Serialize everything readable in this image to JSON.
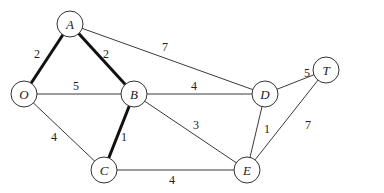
{
  "diagram": {
    "type": "weighted-undirected-graph",
    "nodes": [
      {
        "id": "A",
        "label": "A",
        "x": 70,
        "y": 24
      },
      {
        "id": "O",
        "label": "O",
        "x": 24,
        "y": 94
      },
      {
        "id": "B",
        "label": "B",
        "x": 134,
        "y": 94
      },
      {
        "id": "D",
        "label": "D",
        "x": 265,
        "y": 94
      },
      {
        "id": "T",
        "label": "T",
        "x": 326,
        "y": 70
      },
      {
        "id": "C",
        "label": "C",
        "x": 104,
        "y": 170
      },
      {
        "id": "E",
        "label": "E",
        "x": 247,
        "y": 170
      }
    ],
    "edges": [
      {
        "from": "O",
        "to": "A",
        "weight": "2",
        "highlighted": true,
        "lx": 37,
        "ly": 54
      },
      {
        "from": "A",
        "to": "B",
        "weight": "2",
        "highlighted": true,
        "lx": 106,
        "ly": 54
      },
      {
        "from": "A",
        "to": "D",
        "weight": "7",
        "highlighted": false,
        "lx": 165,
        "ly": 47
      },
      {
        "from": "O",
        "to": "B",
        "weight": "5",
        "highlighted": false,
        "lx": 76,
        "ly": 86
      },
      {
        "from": "B",
        "to": "D",
        "weight": "4",
        "highlighted": false,
        "lx": 194,
        "ly": 86
      },
      {
        "from": "D",
        "to": "T",
        "weight": "5",
        "highlighted": false,
        "lx": 307,
        "ly": 73
      },
      {
        "from": "O",
        "to": "C",
        "weight": "4",
        "highlighted": false,
        "lx": 54,
        "ly": 137
      },
      {
        "from": "B",
        "to": "C",
        "weight": "1",
        "highlighted": true,
        "lx": 124,
        "ly": 137
      },
      {
        "from": "B",
        "to": "E",
        "weight": "3",
        "highlighted": false,
        "lx": 196,
        "ly": 125
      },
      {
        "from": "D",
        "to": "E",
        "weight": "1",
        "highlighted": false,
        "lx": 267,
        "ly": 129
      },
      {
        "from": "T",
        "to": "E",
        "weight": "7",
        "highlighted": false,
        "lx": 308,
        "ly": 125
      },
      {
        "from": "C",
        "to": "E",
        "weight": "4",
        "highlighted": false,
        "lx": 172,
        "ly": 180
      }
    ],
    "node_radius": 13
  }
}
